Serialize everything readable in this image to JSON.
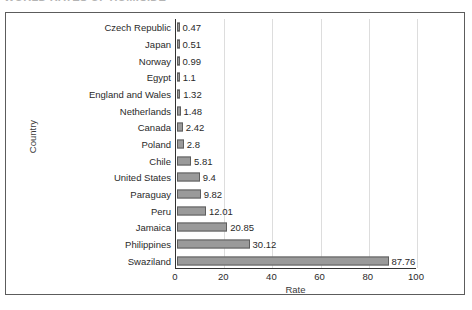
{
  "figure": {
    "clipped_heading_fragment": "WORLD RATES OF HOMICIDE",
    "y_axis_title": "Country",
    "x_axis_title": "Rate"
  },
  "chart_data": {
    "type": "bar",
    "orientation": "horizontal",
    "title": "",
    "xlabel": "Rate",
    "ylabel": "Country",
    "xlim": [
      0,
      100
    ],
    "xticks": [
      0,
      20,
      40,
      60,
      80,
      100
    ],
    "grid": "vertical",
    "legend": "none",
    "categories": [
      "Czech Republic",
      "Japan",
      "Norway",
      "Egypt",
      "England and Wales",
      "Netherlands",
      "Canada",
      "Poland",
      "Chile",
      "United States",
      "Paraguay",
      "Peru",
      "Jamaica",
      "Philippines",
      "Swaziland"
    ],
    "values": [
      0.47,
      0.51,
      0.99,
      1.1,
      1.32,
      1.48,
      2.42,
      2.8,
      5.81,
      9.4,
      9.82,
      12.01,
      20.85,
      30.12,
      87.76
    ],
    "value_labels": [
      "0.47",
      "0.51",
      "0.99",
      "1.1",
      "1.32",
      "1.48",
      "2.42",
      "2.8",
      "5.81",
      "9.4",
      "9.82",
      "12.01",
      "20.85",
      "30.12",
      "87.76"
    ],
    "colors": {
      "bar_fill": "#9a9a9a",
      "bar_stroke": "#5e5e5e",
      "gridline": "#dddddd",
      "axis": "#333333",
      "frame": "#5c5c5c",
      "background": "#ffffff"
    }
  }
}
